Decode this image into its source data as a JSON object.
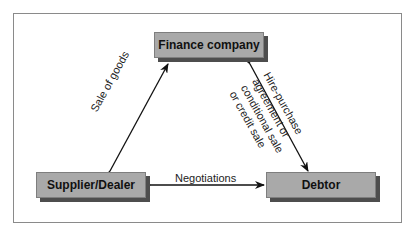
{
  "diagram": {
    "nodes": {
      "finance": "Finance company",
      "supplier": "Supplier/Dealer",
      "debtor": "Debtor"
    },
    "edges": {
      "supplier_finance": "Sale of goods",
      "supplier_debtor": "Negotiations",
      "finance_debtor": {
        "line1": "Hire-purchase",
        "line2": "agreement or",
        "line3": "conditional sale",
        "line4": "or credit sale"
      }
    },
    "colors": {
      "box_fill": "#a9a9a9",
      "box_shadow": "#4d4d4d",
      "arrow": "#111111",
      "frame": "#8a8a8a"
    }
  }
}
